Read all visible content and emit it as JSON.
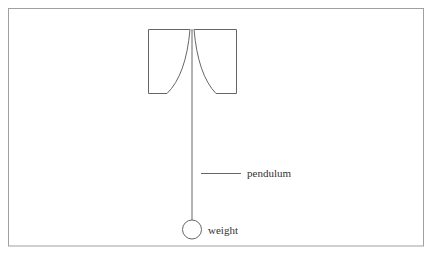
{
  "diagram": {
    "labels": {
      "pendulum": "pendulum",
      "weight": "weight"
    },
    "colors": {
      "stroke": "#555555",
      "frame": "#9a9a9a",
      "text": "#333333",
      "background": "#ffffff"
    }
  }
}
